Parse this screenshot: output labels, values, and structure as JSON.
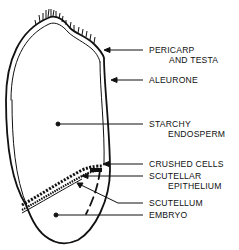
{
  "diagram": {
    "type": "cross-section diagram of a cereal grain (kernel)",
    "colors": {
      "ink": "#111111",
      "background": "#ffffff"
    },
    "labels": [
      {
        "id": "pericarp",
        "line1": "PERICARP",
        "line2": "AND TESTA"
      },
      {
        "id": "aleurone",
        "line1": "ALEURONE"
      },
      {
        "id": "starchy-endosperm",
        "line1": "STARCHY",
        "line2": "ENDOSPERM"
      },
      {
        "id": "crushed-cells",
        "line1": "CRUSHED CELLS"
      },
      {
        "id": "scutellar-epithelium",
        "line1": "SCUTELLAR",
        "line2": "EPITHELIUM"
      },
      {
        "id": "scutellum",
        "line1": "SCUTELLUM"
      },
      {
        "id": "embryo",
        "line1": "EMBRYO"
      }
    ]
  }
}
